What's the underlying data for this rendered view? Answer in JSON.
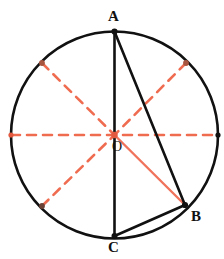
{
  "figure": {
    "background_color": "#ffffff"
  },
  "colors": {
    "stroke_black": "#111111",
    "dashed_red": "#ef6c50",
    "solid_red": "#f0735c",
    "marker_red": "#e2593f"
  },
  "circle": {
    "center": {
      "x": 114.5,
      "y": 135
    },
    "radius": 103.5,
    "stroke_width": 2.6
  },
  "points": {
    "A": {
      "x": 114.5,
      "y": 31.5,
      "label": "A"
    },
    "B": {
      "x": 185,
      "y": 205,
      "label": "B"
    },
    "C": {
      "x": 114.5,
      "y": 236,
      "label": "C"
    },
    "O": {
      "x": 114.5,
      "y": 135,
      "label": "O"
    }
  },
  "solid_segments": [
    {
      "name": "chord-AC",
      "x1": 114.5,
      "y1": 31.5,
      "x2": 114.5,
      "y2": 236,
      "color": "#111111",
      "width": 2.6
    },
    {
      "name": "chord-AB",
      "x1": 114.5,
      "y1": 31.5,
      "x2": 185,
      "y2": 205,
      "color": "#111111",
      "width": 2.6
    },
    {
      "name": "chord-BC",
      "x1": 185,
      "y1": 205,
      "x2": 114.5,
      "y2": 236,
      "color": "#111111",
      "width": 2.6
    },
    {
      "name": "radius-OB",
      "x1": 114.5,
      "y1": 135,
      "x2": 185,
      "y2": 205,
      "color": "#f0735c",
      "width": 2.4
    }
  ],
  "dashed_segments": [
    {
      "name": "diameter-horizontal",
      "x1": 11,
      "y1": 135,
      "x2": 218,
      "y2": 135
    },
    {
      "name": "diagonal-nw-to-center",
      "x1": 42,
      "y1": 63,
      "x2": 114.5,
      "y2": 135
    },
    {
      "name": "diagonal-ne-to-center",
      "x1": 186,
      "y1": 63,
      "x2": 114.5,
      "y2": 135
    },
    {
      "name": "diagonal-sw-to-center",
      "x1": 42,
      "y1": 206,
      "x2": 114.5,
      "y2": 135
    }
  ],
  "circumference_markers": [
    {
      "name": "marker-west",
      "x": 11,
      "y": 135
    },
    {
      "name": "marker-east",
      "x": 218,
      "y": 135
    },
    {
      "name": "marker-northwest",
      "x": 42,
      "y": 63
    },
    {
      "name": "marker-northeast",
      "x": 186,
      "y": 63
    },
    {
      "name": "marker-southwest",
      "x": 42,
      "y": 206
    },
    {
      "name": "marker-center",
      "x": 114.5,
      "y": 135
    }
  ]
}
